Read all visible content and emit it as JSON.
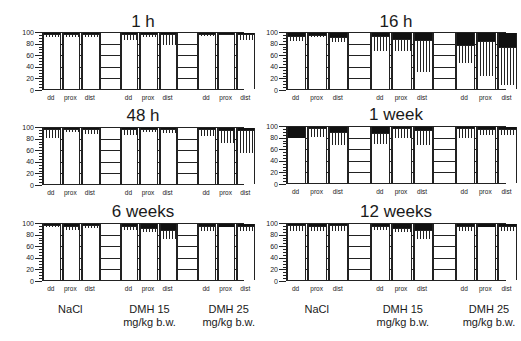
{
  "chart_data": [
    {
      "type": "bar",
      "stacked": true,
      "title": "1 h",
      "categories": [
        "dd",
        "prox",
        "dist",
        "dd",
        "prox",
        "dist",
        "dd",
        "prox",
        "dist"
      ],
      "groups": [
        "NaCl",
        "DMH 15 mg/kg b.w.",
        "DMH 25 mg/kg b.w."
      ],
      "series": [
        {
          "name": "white",
          "values": [
            92,
            92,
            93,
            88,
            93,
            78,
            94,
            96,
            88
          ]
        },
        {
          "name": "hatched",
          "values": [
            6,
            6,
            5,
            10,
            5,
            20,
            5,
            3,
            10
          ]
        },
        {
          "name": "black",
          "values": [
            2,
            2,
            2,
            2,
            2,
            2,
            1,
            1,
            2
          ]
        }
      ],
      "ylim": [
        0,
        100
      ],
      "yticks": [
        0,
        20,
        40,
        60,
        80,
        100
      ]
    },
    {
      "type": "bar",
      "stacked": true,
      "title": "16 h",
      "categories": [
        "dd",
        "prox",
        "dist",
        "dd",
        "prox",
        "dist",
        "dd",
        "prox",
        "dist"
      ],
      "groups": [
        "NaCl",
        "DMH 15 mg/kg b.w.",
        "DMH 25 mg/kg b.w."
      ],
      "series": [
        {
          "name": "white",
          "values": [
            85,
            93,
            84,
            67,
            68,
            31,
            47,
            23,
            7
          ]
        },
        {
          "name": "hatched",
          "values": [
            9,
            4,
            9,
            27,
            22,
            57,
            31,
            62,
            68
          ]
        },
        {
          "name": "black",
          "values": [
            6,
            3,
            7,
            6,
            10,
            12,
            22,
            15,
            25
          ]
        }
      ],
      "ylim": [
        0,
        100
      ],
      "yticks": [
        0,
        20,
        40,
        60,
        80,
        100
      ]
    },
    {
      "type": "bar",
      "stacked": true,
      "title": "48 h",
      "categories": [
        "dd",
        "prox",
        "dist",
        "dd",
        "prox",
        "dist",
        "dd",
        "prox",
        "dist"
      ],
      "groups": [
        "NaCl",
        "DMH 15 mg/kg b.w.",
        "DMH 25 mg/kg b.w."
      ],
      "series": [
        {
          "name": "white",
          "values": [
            82,
            93,
            90,
            87,
            92,
            91,
            86,
            73,
            56
          ]
        },
        {
          "name": "hatched",
          "values": [
            17,
            6,
            9,
            12,
            7,
            8,
            13,
            23,
            40
          ]
        },
        {
          "name": "black",
          "values": [
            1,
            1,
            1,
            1,
            1,
            1,
            1,
            4,
            4
          ]
        }
      ],
      "ylim": [
        0,
        100
      ],
      "yticks": [
        0,
        20,
        40,
        60,
        80,
        100
      ]
    },
    {
      "type": "bar",
      "stacked": true,
      "title": "1 week",
      "categories": [
        "dd",
        "prox",
        "dist",
        "dd",
        "prox",
        "dist",
        "dd",
        "prox",
        "dist"
      ],
      "groups": [
        "NaCl",
        "DMH 15 mg/kg b.w.",
        "DMH 25 mg/kg b.w."
      ],
      "series": [
        {
          "name": "white",
          "values": [
            80,
            83,
            68,
            69,
            80,
            67,
            80,
            85,
            86
          ]
        },
        {
          "name": "hatched",
          "values": [
            0,
            15,
            23,
            20,
            18,
            28,
            19,
            12,
            10
          ]
        },
        {
          "name": "black",
          "values": [
            20,
            2,
            9,
            11,
            2,
            5,
            1,
            3,
            4
          ]
        }
      ],
      "ylim": [
        0,
        100
      ],
      "yticks": [
        0,
        20,
        40,
        60,
        80,
        100
      ]
    },
    {
      "type": "bar",
      "stacked": true,
      "title": "6 weeks",
      "categories": [
        "dd",
        "prox",
        "dist",
        "dd",
        "prox",
        "dist",
        "dd",
        "prox",
        "dist"
      ],
      "groups": [
        "NaCl",
        "DMH 15 mg/kg b.w.",
        "DMH 25 mg/kg b.w."
      ],
      "series": [
        {
          "name": "white",
          "values": [
            94,
            89,
            92,
            89,
            85,
            73,
            88,
            95,
            88
          ]
        },
        {
          "name": "hatched",
          "values": [
            4,
            8,
            6,
            7,
            8,
            17,
            8,
            0,
            9
          ]
        },
        {
          "name": "black",
          "values": [
            2,
            3,
            2,
            4,
            7,
            10,
            4,
            5,
            3
          ]
        }
      ],
      "ylim": [
        0,
        100
      ],
      "yticks": [
        0,
        20,
        40,
        60,
        80,
        100
      ]
    },
    {
      "type": "bar",
      "stacked": true,
      "title": "12 weeks",
      "categories": [
        "dd",
        "prox",
        "dist",
        "dd",
        "prox",
        "dist",
        "dd",
        "prox",
        "dist"
      ],
      "groups": [
        "NaCl",
        "DMH 15 mg/kg b.w.",
        "DMH 25 mg/kg b.w."
      ],
      "series": [
        {
          "name": "white",
          "values": [
            88,
            88,
            87,
            89,
            85,
            73,
            88,
            95,
            88
          ]
        },
        {
          "name": "hatched",
          "values": [
            10,
            8,
            12,
            8,
            8,
            16,
            8,
            0,
            9
          ]
        },
        {
          "name": "black",
          "values": [
            2,
            4,
            1,
            3,
            7,
            11,
            4,
            5,
            3
          ]
        }
      ],
      "ylim": [
        0,
        100
      ],
      "yticks": [
        0,
        20,
        40,
        60,
        80,
        100
      ]
    }
  ],
  "labels": {
    "panels": [
      "1 h",
      "16 h",
      "48 h",
      "1 week",
      "6 weeks",
      "12 weeks"
    ],
    "yticks": [
      "0",
      "20",
      "40",
      "60",
      "80",
      "100"
    ],
    "xcats": [
      "dd",
      "prox",
      "dist"
    ],
    "groups": [
      {
        "line1": "NaCl",
        "line2": ""
      },
      {
        "line1": "DMH 15",
        "line2": "mg/kg b.w."
      },
      {
        "line1": "DMH 25",
        "line2": "mg/kg b.w."
      }
    ]
  }
}
